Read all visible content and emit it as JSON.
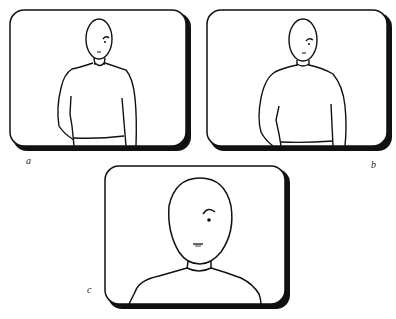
{
  "figure": {
    "panels": [
      {
        "id": "a",
        "label": "a",
        "description": "Long shot: figure shown from head to waist, small in frame"
      },
      {
        "id": "b",
        "label": "b",
        "description": "Medium shot: figure slightly larger, head to waist"
      },
      {
        "id": "c",
        "label": "c",
        "description": "Close-up: head and shoulders fill the frame"
      }
    ],
    "colors": {
      "line": "#111111",
      "background": "#ffffff"
    }
  }
}
